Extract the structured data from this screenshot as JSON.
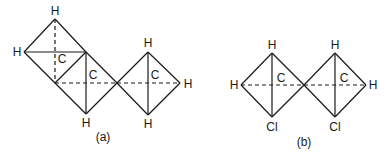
{
  "figure": {
    "panels": [
      {
        "caption": "(a)",
        "atoms": {
          "h_top_left": "H",
          "h_left": "H",
          "c_upper": "C",
          "c_middle": "C",
          "h_bottom_mid": "H",
          "h_top_right": "H",
          "c_right": "C",
          "h_right": "H",
          "h_bottom_right": "H"
        }
      },
      {
        "caption": "(b)",
        "atoms": {
          "h_left": "H",
          "h_top_left": "H",
          "c_left": "C",
          "cl_left": "Cl",
          "h_top_right": "H",
          "c_right": "C",
          "h_right": "H",
          "cl_right": "Cl"
        }
      }
    ]
  }
}
